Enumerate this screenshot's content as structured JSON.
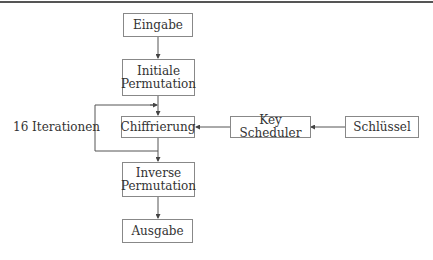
{
  "diagram": {
    "nodes": {
      "input": "Eingabe",
      "initial_permutation_line1": "Initiale",
      "initial_permutation_line2": "Permutation",
      "encryption": "Chiffrierung",
      "key_scheduler": "Key Scheduler",
      "key": "Schlüssel",
      "inverse_permutation_line1": "Inverse",
      "inverse_permutation_line2": "Permutation",
      "output": "Ausgabe"
    },
    "loop_label": "16 Iterationen",
    "edges": [
      {
        "from": "Eingabe",
        "to": "Initiale Permutation"
      },
      {
        "from": "Initiale Permutation",
        "to": "Chiffrierung"
      },
      {
        "from": "Chiffrierung",
        "to": "Chiffrierung",
        "label": "16 Iterationen"
      },
      {
        "from": "Schlüssel",
        "to": "Key Scheduler"
      },
      {
        "from": "Key Scheduler",
        "to": "Chiffrierung"
      },
      {
        "from": "Chiffrierung",
        "to": "Inverse Permutation"
      },
      {
        "from": "Inverse Permutation",
        "to": "Ausgabe"
      }
    ]
  }
}
